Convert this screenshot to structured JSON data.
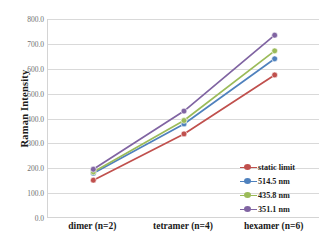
{
  "chart_data": {
    "type": "line",
    "title": "",
    "xlabel": "",
    "ylabel": "Raman Intensity",
    "categories": [
      "dimer (n=2)",
      "tetramer (n=4)",
      "hexamer (n=6)"
    ],
    "ylim": [
      0,
      800
    ],
    "ytick_labels": [
      "0.0",
      "100.0",
      "200.0",
      "300.0",
      "400.0",
      "500.0",
      "600.0",
      "700.0",
      "800.0"
    ],
    "ytick_values": [
      0,
      100,
      200,
      300,
      400,
      500,
      600,
      700,
      800
    ],
    "grid": true,
    "legend_position": "inside-lower-right",
    "series": [
      {
        "name": "static limit",
        "color": "#c0504d",
        "values": [
          152,
          338,
          575
        ]
      },
      {
        "name": "514.5 nm",
        "color": "#4f81bd",
        "values": [
          180,
          378,
          640
        ]
      },
      {
        "name": "435.8 nm",
        "color": "#9bbb59",
        "values": [
          185,
          392,
          672
        ]
      },
      {
        "name": "351.1 nm",
        "color": "#8064a2",
        "values": [
          196,
          430,
          735
        ]
      }
    ]
  },
  "axes": {
    "y_title": "Raman Intensity"
  },
  "colors": {
    "gridline": "#d9d9d9",
    "axis": "#d4d4d4",
    "tick_text": "#6f6f6f",
    "category_text": "#1a1a1a"
  }
}
